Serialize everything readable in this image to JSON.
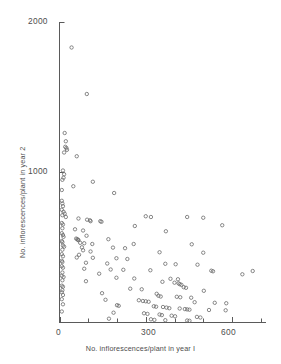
{
  "chart_data": {
    "type": "scatter",
    "title": "",
    "xlabel": "No. inflorescences/plant in year I",
    "ylabel": "No. inflorescences/plant in year 2",
    "xlim": [
      0,
      700
    ],
    "ylim": [
      0,
      2000
    ],
    "grid": false,
    "legend": null,
    "marker": "open-circle",
    "xticks": [
      0,
      300,
      600
    ],
    "xtick_labels": [
      "0",
      "300",
      "600"
    ],
    "xminor_ticks": [
      100,
      200,
      400,
      500,
      700
    ],
    "yticks": [
      1000,
      2000
    ],
    "ytick_labels": [
      "1000",
      "2000"
    ],
    "points": [
      [
        42,
        1830
      ],
      [
        95,
        1520
      ],
      [
        18,
        1260
      ],
      [
        22,
        1205
      ],
      [
        20,
        1168
      ],
      [
        24,
        1160
      ],
      [
        26,
        1148
      ],
      [
        16,
        1130
      ],
      [
        60,
        1105
      ],
      [
        12,
        1010
      ],
      [
        16,
        985
      ],
      [
        14,
        962
      ],
      [
        10,
        948
      ],
      [
        116,
        935
      ],
      [
        48,
        905
      ],
      [
        8,
        880
      ],
      [
        190,
        860
      ],
      [
        8,
        808
      ],
      [
        10,
        790
      ],
      [
        12,
        772
      ],
      [
        8,
        748
      ],
      [
        14,
        735
      ],
      [
        18,
        722
      ],
      [
        10,
        712
      ],
      [
        22,
        700
      ],
      [
        300,
        705
      ],
      [
        318,
        700
      ],
      [
        444,
        700
      ],
      [
        500,
        695
      ],
      [
        66,
        690
      ],
      [
        96,
        682
      ],
      [
        106,
        678
      ],
      [
        108,
        672
      ],
      [
        142,
        672
      ],
      [
        146,
        668
      ],
      [
        8,
        660
      ],
      [
        12,
        650
      ],
      [
        262,
        640
      ],
      [
        566,
        645
      ],
      [
        10,
        625
      ],
      [
        54,
        618
      ],
      [
        82,
        610
      ],
      [
        370,
        605
      ],
      [
        8,
        592
      ],
      [
        12,
        580
      ],
      [
        94,
        575
      ],
      [
        14,
        568
      ],
      [
        58,
        556
      ],
      [
        62,
        552
      ],
      [
        64,
        548
      ],
      [
        66,
        545
      ],
      [
        170,
        552
      ],
      [
        8,
        540
      ],
      [
        10,
        532
      ],
      [
        72,
        528
      ],
      [
        86,
        525
      ],
      [
        114,
        520
      ],
      [
        258,
        520
      ],
      [
        460,
        518
      ],
      [
        12,
        510
      ],
      [
        16,
        502
      ],
      [
        78,
        498
      ],
      [
        186,
        496
      ],
      [
        228,
        492
      ],
      [
        10,
        482
      ],
      [
        82,
        478
      ],
      [
        108,
        470
      ],
      [
        348,
        465
      ],
      [
        500,
        462
      ],
      [
        8,
        452
      ],
      [
        68,
        448
      ],
      [
        12,
        438
      ],
      [
        60,
        430
      ],
      [
        116,
        428
      ],
      [
        198,
        425
      ],
      [
        236,
        420
      ],
      [
        8,
        408
      ],
      [
        10,
        400
      ],
      [
        92,
        395
      ],
      [
        166,
        390
      ],
      [
        368,
        388
      ],
      [
        404,
        385
      ],
      [
        480,
        382
      ],
      [
        8,
        372
      ],
      [
        12,
        362
      ],
      [
        86,
        355
      ],
      [
        178,
        350
      ],
      [
        222,
        348
      ],
      [
        316,
        345
      ],
      [
        528,
        342
      ],
      [
        534,
        338
      ],
      [
        672,
        340
      ],
      [
        10,
        330
      ],
      [
        138,
        322
      ],
      [
        636,
        318
      ],
      [
        8,
        308
      ],
      [
        14,
        300
      ],
      [
        198,
        295
      ],
      [
        260,
        290
      ],
      [
        386,
        288
      ],
      [
        412,
        285
      ],
      [
        10,
        278
      ],
      [
        92,
        272
      ],
      [
        358,
        268
      ],
      [
        400,
        262
      ],
      [
        414,
        258
      ],
      [
        418,
        252
      ],
      [
        424,
        248
      ],
      [
        8,
        242
      ],
      [
        12,
        235
      ],
      [
        432,
        232
      ],
      [
        440,
        228
      ],
      [
        246,
        222
      ],
      [
        286,
        218
      ],
      [
        10,
        212
      ],
      [
        502,
        208
      ],
      [
        8,
        198
      ],
      [
        148,
        192
      ],
      [
        338,
        188
      ],
      [
        12,
        180
      ],
      [
        344,
        175
      ],
      [
        352,
        170
      ],
      [
        408,
        168
      ],
      [
        420,
        165
      ],
      [
        458,
        162
      ],
      [
        8,
        152
      ],
      [
        160,
        148
      ],
      [
        276,
        145
      ],
      [
        290,
        140
      ],
      [
        300,
        138
      ],
      [
        310,
        135
      ],
      [
        470,
        132
      ],
      [
        540,
        128
      ],
      [
        580,
        125
      ],
      [
        12,
        118
      ],
      [
        200,
        112
      ],
      [
        206,
        108
      ],
      [
        328,
        105
      ],
      [
        336,
        102
      ],
      [
        360,
        100
      ],
      [
        372,
        96
      ],
      [
        382,
        92
      ],
      [
        418,
        90
      ],
      [
        436,
        86
      ],
      [
        444,
        84
      ],
      [
        452,
        82
      ],
      [
        520,
        80
      ],
      [
        578,
        78
      ],
      [
        8,
        70
      ],
      [
        188,
        62
      ],
      [
        294,
        58
      ],
      [
        306,
        54
      ],
      [
        348,
        50
      ],
      [
        356,
        46
      ],
      [
        390,
        42
      ],
      [
        402,
        38
      ],
      [
        478,
        34
      ],
      [
        490,
        30
      ],
      [
        172,
        22
      ],
      [
        318,
        18
      ],
      [
        330,
        14
      ],
      [
        368,
        12
      ],
      [
        444,
        10
      ],
      [
        452,
        8
      ]
    ]
  },
  "axes": {
    "x_title": "No. inflorescences/plant in year I",
    "y_title": "No. inflorescences/plant in year 2",
    "xtick_0": "0",
    "xtick_300": "300",
    "xtick_600": "600",
    "ytick_1000": "1000",
    "ytick_2000": "2000"
  },
  "colors": {
    "axis": "#5a5a5a",
    "marker": "#6b6b6b",
    "text": "#4d4d4d",
    "background": "#ffffff"
  }
}
